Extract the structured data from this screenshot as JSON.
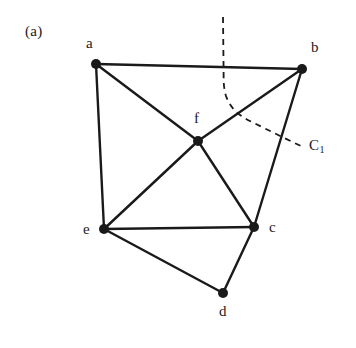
{
  "figure": {
    "panel_label": "(a)",
    "background_color": "#ffffff",
    "ink_color": "#1a1a1a",
    "width": 356,
    "height": 348
  },
  "graph": {
    "vertices": [
      {
        "id": "a",
        "label": "a",
        "x": 96,
        "y": 64,
        "label_x": 86,
        "label_y": 36
      },
      {
        "id": "b",
        "label": "b",
        "x": 302,
        "y": 69,
        "label_x": 311,
        "label_y": 40
      },
      {
        "id": "c",
        "label": "c",
        "x": 254,
        "y": 227,
        "label_x": 269,
        "label_y": 220
      },
      {
        "id": "d",
        "label": "d",
        "x": 223,
        "y": 293,
        "label_x": 219,
        "label_y": 304
      },
      {
        "id": "e",
        "label": "e",
        "x": 104,
        "y": 229,
        "label_x": 83,
        "label_y": 222
      },
      {
        "id": "f",
        "label": "f",
        "x": 198,
        "y": 141,
        "label_x": 194,
        "label_y": 111
      }
    ],
    "edges": [
      {
        "from": "a",
        "to": "b"
      },
      {
        "from": "a",
        "to": "e"
      },
      {
        "from": "a",
        "to": "f"
      },
      {
        "from": "b",
        "to": "f"
      },
      {
        "from": "b",
        "to": "c"
      },
      {
        "from": "f",
        "to": "e"
      },
      {
        "from": "f",
        "to": "c"
      },
      {
        "from": "e",
        "to": "c"
      },
      {
        "from": "e",
        "to": "d"
      },
      {
        "from": "c",
        "to": "d"
      }
    ],
    "vertex_radius": 5,
    "edge_width": 2.4
  },
  "cut_curve": {
    "label": "C",
    "label_subscript": "1",
    "label_x": 309,
    "label_y": 138,
    "dash_pattern": "6,5",
    "stroke_width": 1.8,
    "path": "M 223 17 L 223.5 62 C 223.8 80 223 86 226 96 C 231 110 241 117 254 123 C 268 130 286 139 303 147"
  }
}
